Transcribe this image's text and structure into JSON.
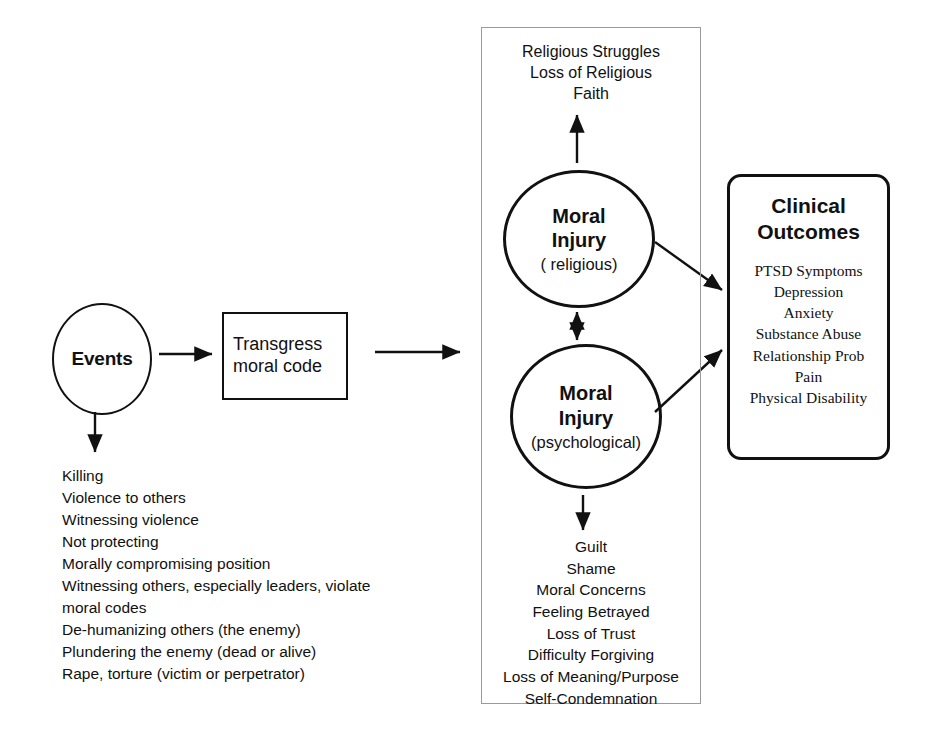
{
  "diagram": {
    "events_node": {
      "label": "Events"
    },
    "transgress_node": {
      "label": "Transgress\nmoral code"
    },
    "events_list": [
      "Killing",
      "Violence to others",
      "Witnessing violence",
      "Not protecting",
      "Morally compromising position",
      "Witnessing others, especially leaders, violate\nmoral codes",
      "De-humanizing others (the enemy)",
      "Plundering the enemy (dead or alive)",
      "Rape, torture (victim or perpetrator)"
    ],
    "religious_struggles": [
      "Religious Struggles",
      "Loss of Religious",
      "Faith"
    ],
    "moral_injury_religious": {
      "title": "Moral\nInjury",
      "subtitle": "( religious)"
    },
    "moral_injury_psychological": {
      "title": "Moral\nInjury",
      "subtitle": "(psychological)"
    },
    "psychological_outcomes": [
      "Guilt",
      "Shame",
      "Moral Concerns",
      "Feeling Betrayed",
      "Loss of Trust",
      "Difficulty Forgiving",
      "Loss of Meaning/Purpose",
      "Self-Condemnation"
    ],
    "clinical_outcomes": {
      "title": "Clinical\nOutcomes",
      "items": [
        "PTSD Symptoms",
        "Depression",
        "Anxiety",
        "Substance Abuse",
        "Relationship Prob",
        "Pain",
        "Physical Disability"
      ]
    },
    "colors": {
      "stroke": "#111111",
      "container_stroke": "#9a9a9a",
      "background": "#ffffff"
    }
  }
}
